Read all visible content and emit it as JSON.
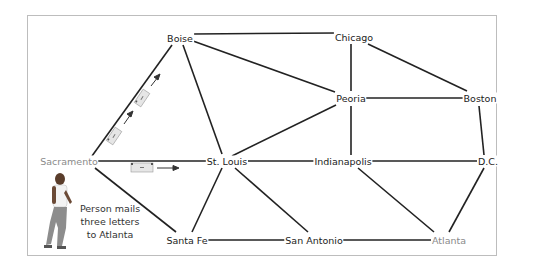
{
  "diagram": {
    "type": "network-graph",
    "caption": "Person mails three letters to Atlanta",
    "caption_lines": [
      "Person mails",
      "three letters",
      "to Atlanta"
    ],
    "colors": {
      "edge": "#222222",
      "label": "#222222",
      "highlight_label": "#8a8a8a",
      "envelope": "#e6e6e6",
      "border": "#bdbdbd"
    },
    "nodes": [
      {
        "id": "boise",
        "label": "Boise"
      },
      {
        "id": "chicago",
        "label": "Chicago"
      },
      {
        "id": "peoria",
        "label": "Peoria"
      },
      {
        "id": "boston",
        "label": "Boston"
      },
      {
        "id": "sacramento",
        "label": "Sacramento"
      },
      {
        "id": "stlouis",
        "label": "St. Louis"
      },
      {
        "id": "indianapolis",
        "label": "Indianapolis"
      },
      {
        "id": "dc",
        "label": "D.C."
      },
      {
        "id": "santafe",
        "label": "Santa Fe"
      },
      {
        "id": "sanantonio",
        "label": "San Antonio"
      },
      {
        "id": "atlanta",
        "label": "Atlanta"
      }
    ],
    "edges": [
      [
        "Boise",
        "Chicago"
      ],
      [
        "Boise",
        "Peoria"
      ],
      [
        "Boise",
        "St. Louis"
      ],
      [
        "Boise",
        "Sacramento"
      ],
      [
        "Chicago",
        "Peoria"
      ],
      [
        "Chicago",
        "Boston"
      ],
      [
        "Peoria",
        "Boston"
      ],
      [
        "Peoria",
        "St. Louis"
      ],
      [
        "Peoria",
        "Indianapolis"
      ],
      [
        "Boston",
        "D.C."
      ],
      [
        "Sacramento",
        "St. Louis"
      ],
      [
        "Sacramento",
        "Santa Fe"
      ],
      [
        "St. Louis",
        "Indianapolis"
      ],
      [
        "St. Louis",
        "Santa Fe"
      ],
      [
        "St. Louis",
        "San Antonio"
      ],
      [
        "Indianapolis",
        "D.C."
      ],
      [
        "Indianapolis",
        "Atlanta"
      ],
      [
        "D.C.",
        "Atlanta"
      ],
      [
        "Santa Fe",
        "San Antonio"
      ],
      [
        "San Antonio",
        "Atlanta"
      ]
    ],
    "source": "Sacramento",
    "destination": "Atlanta",
    "letters": 3
  }
}
